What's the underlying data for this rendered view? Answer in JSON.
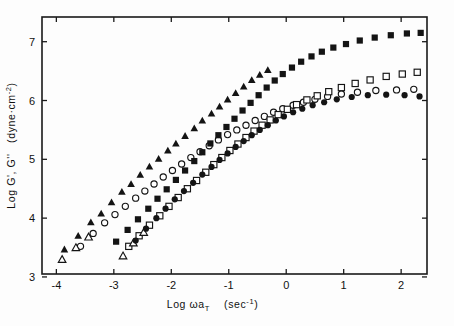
{
  "figure": {
    "name": "master-curve-storage-loss-moduli",
    "background": "#fdfdfd",
    "ink": "#141414"
  },
  "chart_data": {
    "type": "scatter",
    "title": "",
    "xlabel": "Log ωa",
    "xlabel_sub": "T",
    "xlabel_units": "(sec",
    "xlabel_units_sup": "-1",
    "xlabel_units_close": ")",
    "ylabel": "Log G', G''",
    "ylabel_units": "(dyne·cm",
    "ylabel_units_sup": "-2",
    "ylabel_units_close": ")",
    "xlim": [
      -4.25,
      2.45
    ],
    "ylim": [
      3.05,
      7.42
    ],
    "xticks": [
      -4,
      -3,
      -2,
      -1,
      0,
      1,
      2
    ],
    "xticklabels": [
      "-4",
      "-3",
      "-2",
      "-1",
      "0",
      "1",
      "2"
    ],
    "yticks": [
      3,
      4,
      5,
      6,
      7
    ],
    "yticklabels": [
      "3",
      "4",
      "5",
      "6",
      "7"
    ],
    "grid": false,
    "legend": "none",
    "frame": "box",
    "tick_direction": "in",
    "series": [
      {
        "name": "G' sample A",
        "marker": "filled-triangle",
        "filled": true,
        "points": [
          [
            -3.86,
            3.47
          ],
          [
            -3.62,
            3.7
          ],
          [
            -3.4,
            3.93
          ],
          [
            -3.22,
            4.08
          ],
          [
            -3.04,
            4.27
          ],
          [
            -2.86,
            4.45
          ],
          [
            -2.7,
            4.58
          ],
          [
            -2.54,
            4.74
          ],
          [
            -2.38,
            4.88
          ],
          [
            -2.22,
            5.01
          ],
          [
            -2.06,
            5.15
          ],
          [
            -1.92,
            5.27
          ],
          [
            -1.76,
            5.4
          ],
          [
            -1.6,
            5.53
          ],
          [
            -1.46,
            5.66
          ],
          [
            -1.3,
            5.78
          ],
          [
            -1.16,
            5.9
          ],
          [
            -1.02,
            6.02
          ],
          [
            -0.88,
            6.13
          ],
          [
            -0.74,
            6.24
          ],
          [
            -0.6,
            6.35
          ],
          [
            -0.46,
            6.44
          ],
          [
            -0.32,
            6.52
          ]
        ]
      },
      {
        "name": "G'' sample A",
        "marker": "open-circle",
        "filled": false,
        "points": [
          [
            -3.58,
            3.52
          ],
          [
            -3.36,
            3.74
          ],
          [
            -3.16,
            3.92
          ],
          [
            -2.98,
            4.06
          ],
          [
            -2.8,
            4.2
          ],
          [
            -2.62,
            4.34
          ],
          [
            -2.46,
            4.46
          ],
          [
            -2.3,
            4.58
          ],
          [
            -2.14,
            4.7
          ],
          [
            -1.98,
            4.81
          ],
          [
            -1.82,
            4.92
          ],
          [
            -1.66,
            5.03
          ],
          [
            -1.5,
            5.13
          ],
          [
            -1.34,
            5.23
          ],
          [
            -1.18,
            5.33
          ],
          [
            -1.02,
            5.42
          ],
          [
            -0.86,
            5.5
          ],
          [
            -0.7,
            5.58
          ],
          [
            -0.54,
            5.66
          ],
          [
            -0.38,
            5.73
          ],
          [
            -0.22,
            5.8
          ],
          [
            -0.06,
            5.86
          ],
          [
            0.12,
            5.92
          ],
          [
            0.3,
            5.97
          ],
          [
            0.5,
            6.02
          ],
          [
            0.72,
            6.07
          ],
          [
            0.96,
            6.11
          ],
          [
            1.24,
            6.14
          ],
          [
            1.56,
            6.17
          ],
          [
            1.92,
            6.18
          ],
          [
            2.22,
            6.19
          ]
        ]
      },
      {
        "name": "G' sample B",
        "marker": "filled-square",
        "filled": true,
        "points": [
          [
            -2.96,
            3.6
          ],
          [
            -2.76,
            3.8
          ],
          [
            -2.58,
            3.98
          ],
          [
            -2.4,
            4.16
          ],
          [
            -2.24,
            4.33
          ],
          [
            -2.08,
            4.49
          ],
          [
            -1.92,
            4.65
          ],
          [
            -1.76,
            4.81
          ],
          [
            -1.6,
            4.97
          ],
          [
            -1.46,
            5.12
          ],
          [
            -1.32,
            5.27
          ],
          [
            -1.18,
            5.41
          ],
          [
            -1.04,
            5.55
          ],
          [
            -0.9,
            5.69
          ],
          [
            -0.76,
            5.83
          ],
          [
            -0.62,
            5.96
          ],
          [
            -0.48,
            6.09
          ],
          [
            -0.34,
            6.22
          ],
          [
            -0.2,
            6.34
          ],
          [
            -0.06,
            6.45
          ],
          [
            0.1,
            6.56
          ],
          [
            0.26,
            6.66
          ],
          [
            0.44,
            6.75
          ],
          [
            0.62,
            6.83
          ],
          [
            0.82,
            6.9
          ],
          [
            1.04,
            6.96
          ],
          [
            1.28,
            7.02
          ],
          [
            1.54,
            7.07
          ],
          [
            1.82,
            7.11
          ],
          [
            2.1,
            7.14
          ],
          [
            2.34,
            7.15
          ]
        ]
      },
      {
        "name": "G'' sample B",
        "marker": "open-square",
        "filled": false,
        "points": [
          [
            -2.74,
            3.52
          ],
          [
            -2.56,
            3.7
          ],
          [
            -2.38,
            3.88
          ],
          [
            -2.2,
            4.04
          ],
          [
            -2.04,
            4.2
          ],
          [
            -1.88,
            4.35
          ],
          [
            -1.72,
            4.5
          ],
          [
            -1.56,
            4.64
          ],
          [
            -1.4,
            4.78
          ],
          [
            -1.26,
            4.91
          ],
          [
            -1.12,
            5.03
          ],
          [
            -0.98,
            5.15
          ],
          [
            -0.84,
            5.26
          ],
          [
            -0.7,
            5.37
          ],
          [
            -0.56,
            5.48
          ],
          [
            -0.42,
            5.58
          ],
          [
            -0.28,
            5.67
          ],
          [
            -0.14,
            5.76
          ],
          [
            0.02,
            5.85
          ],
          [
            0.18,
            5.93
          ],
          [
            0.36,
            6.01
          ],
          [
            0.54,
            6.08
          ],
          [
            0.74,
            6.15
          ],
          [
            0.96,
            6.22
          ],
          [
            1.2,
            6.29
          ],
          [
            1.46,
            6.35
          ],
          [
            1.74,
            6.41
          ],
          [
            2.02,
            6.45
          ],
          [
            2.28,
            6.48
          ]
        ]
      },
      {
        "name": "G' sample C",
        "marker": "open-triangle",
        "filled": false,
        "points": [
          [
            -3.9,
            3.3
          ],
          [
            -3.66,
            3.5
          ],
          [
            -3.44,
            3.68
          ],
          [
            -2.84,
            3.36
          ],
          [
            -2.66,
            3.58
          ],
          [
            -2.48,
            3.76
          ]
        ]
      },
      {
        "name": "G'' sample C",
        "marker": "filled-circle",
        "filled": true,
        "points": [
          [
            -2.62,
            3.62
          ],
          [
            -2.44,
            3.82
          ],
          [
            -2.26,
            4.0
          ],
          [
            -2.1,
            4.16
          ],
          [
            -1.94,
            4.32
          ],
          [
            -1.78,
            4.46
          ],
          [
            -1.62,
            4.6
          ],
          [
            -1.46,
            4.74
          ],
          [
            -1.3,
            4.87
          ],
          [
            -1.16,
            4.99
          ],
          [
            -1.02,
            5.1
          ],
          [
            -0.88,
            5.21
          ],
          [
            -0.74,
            5.31
          ],
          [
            -0.6,
            5.41
          ],
          [
            -0.46,
            5.5
          ],
          [
            -0.32,
            5.58
          ],
          [
            -0.18,
            5.66
          ],
          [
            -0.04,
            5.73
          ],
          [
            0.12,
            5.8
          ],
          [
            0.28,
            5.86
          ],
          [
            0.46,
            5.92
          ],
          [
            0.66,
            5.97
          ],
          [
            0.88,
            6.02
          ],
          [
            1.14,
            6.06
          ],
          [
            1.42,
            6.09
          ],
          [
            1.74,
            6.1
          ],
          [
            2.06,
            6.09
          ],
          [
            2.32,
            6.07
          ]
        ]
      }
    ]
  }
}
